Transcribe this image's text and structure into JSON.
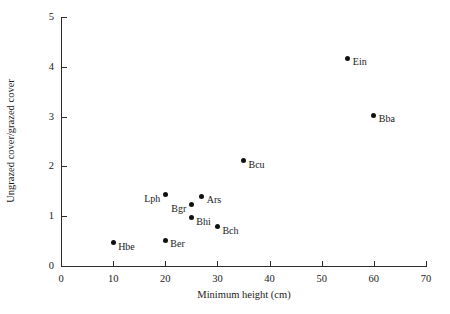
{
  "chart_data": {
    "type": "scatter",
    "title": "",
    "xlabel": "Minimum height (cm)",
    "ylabel": "Ungrazed cover/grazed cover",
    "xlim": [
      0,
      70
    ],
    "ylim": [
      0,
      5
    ],
    "xticks": [
      0,
      10,
      20,
      30,
      40,
      50,
      60,
      70
    ],
    "yticks": [
      0,
      1,
      2,
      3,
      4,
      5
    ],
    "xtick_labels": [
      "0",
      "10",
      "20",
      "30",
      "40",
      "50",
      "60",
      "70"
    ],
    "ytick_labels": [
      "0",
      "1",
      "2",
      "3",
      "4",
      "5"
    ],
    "grid": false,
    "legend": "none",
    "marker_color": "#111111",
    "axis_color": "#2b2b2b",
    "points": [
      {
        "label": "Hbe",
        "x": 10,
        "y": 0.47,
        "label_side": "right"
      },
      {
        "label": "Ber",
        "x": 20,
        "y": 0.52,
        "label_side": "right"
      },
      {
        "label": "Bch",
        "x": 30,
        "y": 0.79,
        "label_side": "right"
      },
      {
        "label": "Bhi",
        "x": 25,
        "y": 0.97,
        "label_side": "right"
      },
      {
        "label": "Bgr",
        "x": 25,
        "y": 1.23,
        "label_side": "left"
      },
      {
        "label": "Ars",
        "x": 27,
        "y": 1.4,
        "label_side": "right"
      },
      {
        "label": "Lph",
        "x": 20,
        "y": 1.43,
        "label_side": "left"
      },
      {
        "label": "Bcu",
        "x": 35,
        "y": 2.11,
        "label_side": "right"
      },
      {
        "label": "Bba",
        "x": 60,
        "y": 3.03,
        "label_side": "right"
      },
      {
        "label": "Ein",
        "x": 55,
        "y": 4.17,
        "label_side": "right"
      }
    ]
  }
}
